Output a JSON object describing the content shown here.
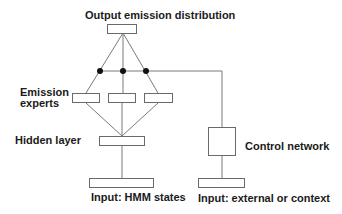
{
  "diagram": {
    "labels": {
      "output": "Output emission distribution",
      "experts_line1": "Emission",
      "experts_line2": "experts",
      "hidden": "Hidden layer",
      "control": "Control network",
      "input_hmm": "Input: HMM states",
      "input_external": "Input: external or context"
    },
    "nodes": [
      {
        "id": "output",
        "label": "Output emission distribution"
      },
      {
        "id": "gate-1",
        "type": "gating-dot"
      },
      {
        "id": "gate-2",
        "type": "gating-dot"
      },
      {
        "id": "gate-3",
        "type": "gating-dot"
      },
      {
        "id": "expert-1",
        "label": "Emission experts"
      },
      {
        "id": "expert-2",
        "label": "Emission experts"
      },
      {
        "id": "expert-3",
        "label": "Emission experts"
      },
      {
        "id": "hidden",
        "label": "Hidden layer"
      },
      {
        "id": "input-hmm",
        "label": "Input: HMM states"
      },
      {
        "id": "control",
        "label": "Control network"
      },
      {
        "id": "input-external",
        "label": "Input: external or context"
      }
    ],
    "edges": [
      [
        "input-hmm",
        "hidden"
      ],
      [
        "hidden",
        "expert-1"
      ],
      [
        "hidden",
        "expert-2"
      ],
      [
        "hidden",
        "expert-3"
      ],
      [
        "expert-1",
        "gate-1"
      ],
      [
        "expert-2",
        "gate-2"
      ],
      [
        "expert-3",
        "gate-3"
      ],
      [
        "gate-1",
        "output"
      ],
      [
        "gate-2",
        "output"
      ],
      [
        "gate-3",
        "output"
      ],
      [
        "input-external",
        "control"
      ],
      [
        "control",
        "gate-1"
      ],
      [
        "control",
        "gate-2"
      ],
      [
        "control",
        "gate-3"
      ]
    ]
  }
}
